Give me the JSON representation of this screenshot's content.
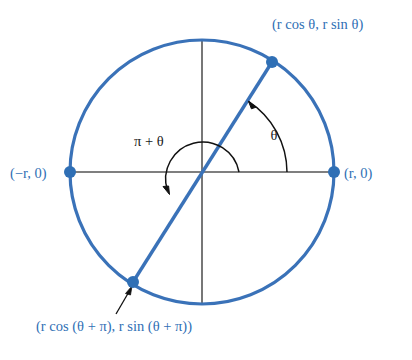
{
  "figure": {
    "kind": "unit-circle-angle-diagram",
    "background_color": "#ffffff",
    "colors": {
      "circle_stroke": "#3a72b8",
      "diameter_stroke": "#3a72b8",
      "point_fill": "#2f6fb5",
      "label_blue": "#2f6fb5",
      "axis_stroke": "#555555",
      "arc_stroke": "#111111",
      "label_black": "#1a1a1a"
    },
    "geometry": {
      "center_x": 202,
      "center_y": 172,
      "radius": 132,
      "theta_degrees": 58,
      "theta_arc_radius": 85,
      "pi_plus_theta_arc_radius": 37
    }
  },
  "labels": {
    "point_upper_right": {
      "full": "(r cos θ, r sin θ)",
      "parts": [
        "(",
        "r",
        " cos ",
        "θ",
        ", ",
        "r",
        " sin ",
        "θ",
        ")"
      ],
      "color": "#2f6fb5",
      "x": 272,
      "y": 28
    },
    "point_lower_left": {
      "full": "(r cos (θ + π), r sin (θ + π))",
      "color": "#2f6fb5",
      "x": 36,
      "y": 330
    },
    "point_right_axis": {
      "full": "(r, 0)",
      "color": "#2f6fb5",
      "x": 342,
      "y": 178
    },
    "point_left_axis": {
      "full": "(−r, 0)",
      "color": "#2f6fb5",
      "x": 10,
      "y": 178
    },
    "angle_theta": {
      "full": "θ",
      "color": "#1a1a1a",
      "x": 274,
      "y": 140
    },
    "angle_pi_plus_theta": {
      "full": "π + θ",
      "color": "#1a1a1a",
      "x": 134,
      "y": 146
    }
  },
  "points": [
    {
      "name": "upper-right-point",
      "x": 272,
      "y": 62,
      "label": "(r cos θ, r sin θ)"
    },
    {
      "name": "lower-left-point",
      "x": 133,
      "y": 282,
      "label": "(r cos (θ + π), r sin (θ + π))"
    },
    {
      "name": "right-axis-point",
      "x": 334,
      "y": 172,
      "label": "(r, 0)"
    },
    {
      "name": "left-axis-point",
      "x": 70,
      "y": 172,
      "label": "(−r, 0)"
    }
  ]
}
